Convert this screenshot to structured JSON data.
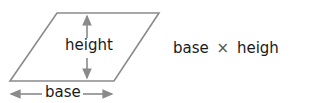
{
  "diagram": {
    "shape": "parallelogram",
    "labels": {
      "height": "height",
      "base": "base"
    },
    "formula": {
      "left": "base",
      "operator": "×",
      "right": "height"
    },
    "colors": {
      "outline": "#8a8a8a",
      "text": "#1a1a1a"
    }
  }
}
